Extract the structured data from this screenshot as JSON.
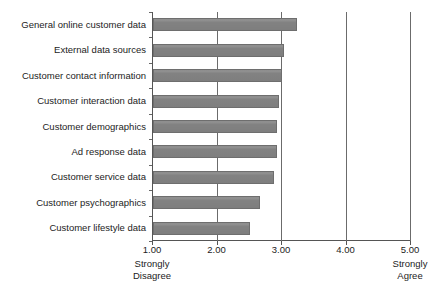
{
  "chart_data": {
    "type": "bar",
    "orientation": "horizontal",
    "title": "",
    "subtitle": "",
    "xlabel": "",
    "ylabel": "",
    "xlim": [
      1.0,
      5.0
    ],
    "grid": true,
    "legend": false,
    "legend_position": "none",
    "xticks": [
      "1.00",
      "2.00",
      "3.00",
      "4.00",
      "5.00"
    ],
    "xtick_values": [
      1.0,
      2.0,
      3.0,
      4.0,
      5.0
    ],
    "categories": [
      "General online customer data",
      "External data sources",
      "Customer contact information",
      "Customer interaction data",
      "Customer demographics",
      "Ad response data",
      "Customer service data",
      "Customer psychographics",
      "Customer lifestyle data"
    ],
    "values": [
      3.23,
      3.03,
      3.0,
      2.96,
      2.93,
      2.93,
      2.88,
      2.66,
      2.5
    ],
    "scale_anchors": {
      "low": {
        "line1": "Strongly",
        "line2": "Disagree",
        "value": 1.0
      },
      "high": {
        "line1": "Strongly",
        "line2": "Agree",
        "value": 5.0
      }
    },
    "colors": {
      "bar_fill": "#828282",
      "bar_border": "#6e6e6e",
      "gridline": "#6b6b6b",
      "axis": "#555555",
      "text": "#1c1c1c",
      "background": "#ffffff"
    }
  }
}
